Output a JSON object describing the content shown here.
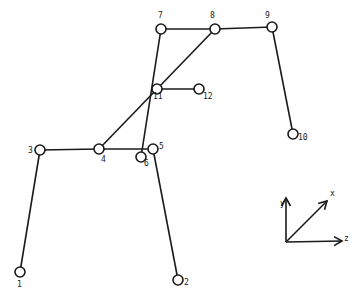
{
  "diagram": {
    "type": "structural-frame-node-graph",
    "nodes": [
      {
        "id": "1",
        "label": "1",
        "x": 20,
        "y": 272,
        "lx": 17,
        "ly": 287
      },
      {
        "id": "2",
        "label": "2",
        "x": 178,
        "y": 280,
        "lx": 184,
        "ly": 285
      },
      {
        "id": "3",
        "label": "3",
        "x": 40,
        "y": 150,
        "lx": 28,
        "ly": 153
      },
      {
        "id": "4",
        "label": "4",
        "x": 99,
        "y": 149,
        "lx": 101,
        "ly": 162
      },
      {
        "id": "5",
        "label": "5",
        "x": 153,
        "y": 149,
        "lx": 159,
        "ly": 149
      },
      {
        "id": "6",
        "label": "6",
        "x": 141,
        "y": 157,
        "lx": 144,
        "ly": 166
      },
      {
        "id": "7",
        "label": "7",
        "x": 161,
        "y": 29,
        "lx": 158,
        "ly": 18
      },
      {
        "id": "8",
        "label": "8",
        "x": 215,
        "y": 29,
        "lx": 210,
        "ly": 18
      },
      {
        "id": "9",
        "label": "9",
        "x": 272,
        "y": 27,
        "lx": 265,
        "ly": 18
      },
      {
        "id": "10",
        "label": "10",
        "x": 293,
        "y": 134,
        "lx": 298,
        "ly": 140
      },
      {
        "id": "11",
        "label": "11",
        "x": 157,
        "y": 89,
        "lx": 153,
        "ly": 99
      },
      {
        "id": "12",
        "label": "12",
        "x": 199,
        "y": 89,
        "lx": 203,
        "ly": 99
      }
    ],
    "edges": [
      {
        "from": "1",
        "to": "3"
      },
      {
        "from": "3",
        "to": "4"
      },
      {
        "from": "4",
        "to": "5"
      },
      {
        "from": "5",
        "to": "2"
      },
      {
        "from": "6",
        "to": "7"
      },
      {
        "from": "7",
        "to": "8"
      },
      {
        "from": "8",
        "to": "9"
      },
      {
        "from": "9",
        "to": "10"
      },
      {
        "from": "4",
        "to": "8"
      },
      {
        "from": "11",
        "to": "12"
      }
    ],
    "node_radius": 5,
    "axes": {
      "origin": {
        "x": 286,
        "y": 242
      },
      "items": [
        {
          "name": "y",
          "label": "y",
          "x2": 286,
          "y2": 198,
          "lx": 280,
          "ly": 206
        },
        {
          "name": "x",
          "label": "x",
          "x2": 327,
          "y2": 201,
          "lx": 330,
          "ly": 196
        },
        {
          "name": "z",
          "label": "z",
          "x2": 342,
          "y2": 241,
          "lx": 344,
          "ly": 241
        }
      ]
    },
    "colors": {
      "stroke": "#1a1a1a",
      "background": "#ffffff"
    }
  }
}
